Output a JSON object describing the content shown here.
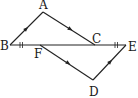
{
  "diagram": {
    "type": "geometry",
    "points": {
      "A": {
        "label": "A",
        "x": 43,
        "y": 12,
        "lx": 39,
        "ly": 9
      },
      "B": {
        "label": "B",
        "x": 10,
        "y": 45,
        "lx": 0,
        "ly": 50
      },
      "C": {
        "label": "C",
        "x": 95,
        "y": 45,
        "lx": 92,
        "ly": 43
      },
      "E": {
        "label": "E",
        "x": 126,
        "y": 45,
        "lx": 128,
        "ly": 51
      },
      "F": {
        "label": "F",
        "x": 40,
        "y": 45,
        "lx": 34,
        "ly": 58
      },
      "D": {
        "label": "D",
        "x": 93,
        "y": 80,
        "lx": 89,
        "ly": 96
      }
    },
    "segments": [
      "AB",
      "AC",
      "BE",
      "FD",
      "DE"
    ],
    "parallel_marks": [
      {
        "segment": "AB",
        "note": "single arrow"
      },
      {
        "segment": "DE",
        "note": "single arrow"
      },
      {
        "segment": "AC",
        "note": "single arrow"
      },
      {
        "segment": "FD",
        "note": "single arrow"
      }
    ],
    "equal_marks": [
      {
        "segment": "BF",
        "ticks": 2
      },
      {
        "segment": "CE",
        "ticks": 2
      }
    ],
    "colors": {
      "stroke": "#222222",
      "background": "#ffffff"
    }
  }
}
